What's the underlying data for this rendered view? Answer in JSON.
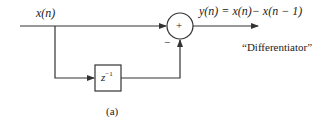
{
  "diagram": {
    "input_label": "x(n)",
    "output_label": "y(n) = x(n)− x(n − 1)",
    "delay_label": "z",
    "delay_exponent": "−1",
    "adder_symbol": "+",
    "minus_sign": "−",
    "title": "“Differentiator”",
    "caption": "(a)",
    "colors": {
      "line": "#333333",
      "background": "#ffffff"
    }
  }
}
